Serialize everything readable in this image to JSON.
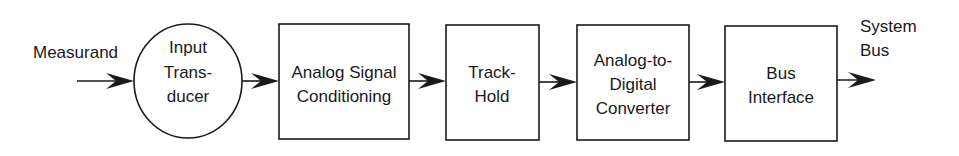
{
  "diagram": {
    "type": "block-diagram",
    "colors": {
      "stroke": "#1a1a1a",
      "background": "#ffffff"
    },
    "input_label": "Measurand",
    "output_label": {
      "line1": "System",
      "line2": "Bus"
    },
    "blocks": [
      {
        "shape": "circle",
        "lines": [
          "Input",
          "Trans-",
          "ducer"
        ]
      },
      {
        "shape": "rect",
        "lines": [
          "Analog Signal",
          "Conditioning"
        ]
      },
      {
        "shape": "rect",
        "lines": [
          "Track-",
          "Hold"
        ]
      },
      {
        "shape": "rect",
        "lines": [
          "Analog-to-",
          "Digital",
          "Converter"
        ]
      },
      {
        "shape": "rect",
        "lines": [
          "Bus",
          "Interface"
        ]
      }
    ],
    "flow": [
      "Measurand",
      "Input Transducer",
      "Analog Signal Conditioning",
      "Track-Hold",
      "Analog-to-Digital Converter",
      "Bus Interface",
      "System Bus"
    ]
  }
}
